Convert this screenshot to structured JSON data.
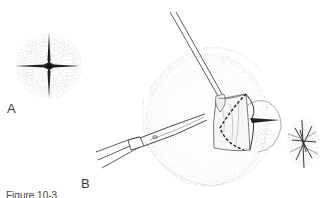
{
  "figure": {
    "panels": [
      {
        "label": "A",
        "description": "closed circular stoma with cruciate incision"
      },
      {
        "label": "B",
        "description": "forceps lifting flap while curved scissors excise tissue along dashed line"
      }
    ],
    "caption_fragment": "Figure 10-3"
  },
  "colors": {
    "ink": "#333333",
    "stipple": "#9a9a9a",
    "background": "#ffffff"
  }
}
